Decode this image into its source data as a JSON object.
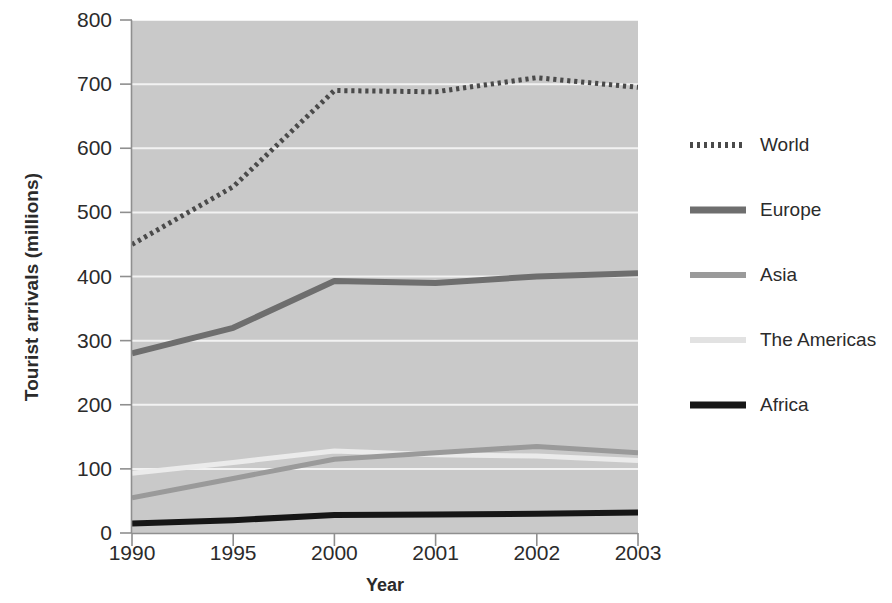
{
  "chart_data": {
    "type": "line",
    "title": "",
    "xlabel": "Year",
    "ylabel": "Tourist arrivals (millions)",
    "categories": [
      "1990",
      "1995",
      "2000",
      "2001",
      "2002",
      "2003"
    ],
    "x": [
      1990,
      1995,
      2000,
      2001,
      2002,
      2003
    ],
    "xticklabels": [
      "1990",
      "1995",
      "2000",
      "2001",
      "2002",
      "2003"
    ],
    "yticklabels": [
      "0",
      "100",
      "200",
      "300",
      "400",
      "500",
      "600",
      "700",
      "800"
    ],
    "yticks": [
      0,
      100,
      200,
      300,
      400,
      500,
      600,
      700,
      800
    ],
    "ylim": [
      0,
      800
    ],
    "grid": "horizontal-white",
    "legend_position": "right",
    "plot_background": "#c9c9c9",
    "series": [
      {
        "name": "World",
        "values": [
          450,
          540,
          690,
          688,
          710,
          695
        ],
        "color": "#4a4a4a",
        "style": "dotted",
        "width": 5
      },
      {
        "name": "Europe",
        "values": [
          280,
          320,
          393,
          390,
          400,
          405
        ],
        "color": "#6e6e6e",
        "style": "solid",
        "width": 6
      },
      {
        "name": "Asia",
        "values": [
          55,
          85,
          115,
          125,
          135,
          125
        ],
        "color": "#9a9a9a",
        "style": "solid",
        "width": 5
      },
      {
        "name": "The Americas",
        "values": [
          93,
          110,
          128,
          122,
          120,
          113
        ],
        "color": "#ebebeb",
        "style": "solid",
        "width": 5
      },
      {
        "name": "Africa",
        "values": [
          15,
          20,
          28,
          29,
          30,
          32
        ],
        "color": "#161616",
        "style": "solid",
        "width": 6
      }
    ]
  },
  "axes": {
    "y_title": "Tourist arrivals (millions)",
    "x_title": "Year"
  },
  "legend": {
    "items": [
      {
        "label": "World",
        "color": "#4a4a4a",
        "style": "dotted",
        "width": 6
      },
      {
        "label": "Europe",
        "color": "#6e6e6e",
        "style": "solid",
        "width": 7
      },
      {
        "label": "Asia",
        "color": "#9a9a9a",
        "style": "solid",
        "width": 6
      },
      {
        "label": "The Americas",
        "color": "#e2e2e2",
        "style": "solid",
        "width": 6
      },
      {
        "label": "Africa",
        "color": "#161616",
        "style": "solid",
        "width": 7
      }
    ]
  }
}
